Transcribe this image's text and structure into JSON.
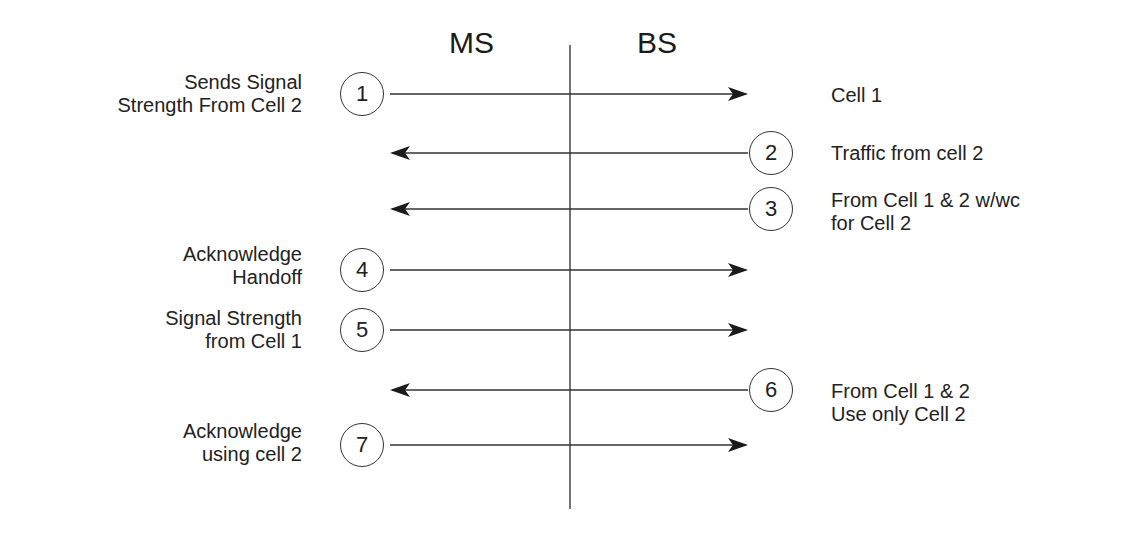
{
  "headers": {
    "ms": "MS",
    "bs": "BS"
  },
  "steps": [
    {
      "number": "1",
      "direction": "MS->BS",
      "left_label": [
        "Sends Signal",
        "Strength From Cell 2"
      ],
      "right_label": [
        "Cell 1"
      ]
    },
    {
      "number": "2",
      "direction": "BS->MS",
      "left_label": [],
      "right_label": [
        "Traffic from cell 2"
      ]
    },
    {
      "number": "3",
      "direction": "BS->MS",
      "left_label": [],
      "right_label": [
        "From Cell 1 & 2 w/wc",
        "for Cell 2"
      ]
    },
    {
      "number": "4",
      "direction": "MS->BS",
      "left_label": [
        "Acknowledge",
        "Handoff"
      ],
      "right_label": []
    },
    {
      "number": "5",
      "direction": "MS->BS",
      "left_label": [
        "Signal Strength",
        "from Cell 1"
      ],
      "right_label": []
    },
    {
      "number": "6",
      "direction": "BS->MS",
      "left_label": [],
      "right_label": [
        "From Cell 1 & 2",
        "Use only Cell 2"
      ]
    },
    {
      "number": "7",
      "direction": "MS->BS",
      "left_label": [
        "Acknowledge",
        "using cell 2"
      ],
      "right_label": []
    }
  ],
  "colors": {
    "line": "#333333",
    "text": "#222222",
    "background": "#ffffff"
  }
}
